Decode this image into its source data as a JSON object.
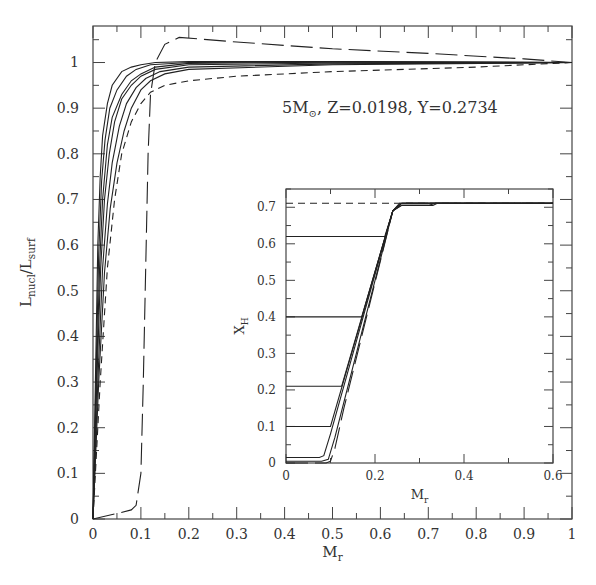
{
  "chart_data": [
    {
      "id": "main",
      "type": "line",
      "title": "",
      "annotation": "5M⊙, Z=0.0198, Y=0.2734",
      "annotation_parts": {
        "mass": "5M",
        "sun_symbol": "⊙",
        "rest": ", Z=0.0198, Y=0.2734"
      },
      "xlabel": "M_r",
      "ylabel": "L_nucl/L_surf",
      "xlim": [
        0,
        1
      ],
      "ylim": [
        0,
        1.08
      ],
      "grid": false,
      "xticks": [
        0,
        0.1,
        0.2,
        0.3,
        0.4,
        0.5,
        0.6,
        0.7,
        0.8,
        0.9,
        1
      ],
      "xtick_labels": [
        "0",
        "0.1",
        "0.2",
        "0.3",
        "0.4",
        "0.5",
        "0.6",
        "0.7",
        "0.8",
        "0.9",
        "1"
      ],
      "yticks": [
        0,
        0.1,
        0.2,
        0.3,
        0.4,
        0.5,
        0.6,
        0.7,
        0.8,
        0.9,
        1
      ],
      "ytick_labels": [
        "0",
        "0.1",
        "0.2",
        "0.3",
        "0.4",
        "0.5",
        "0.6",
        "0.7",
        "0.8",
        "0.9",
        "1"
      ],
      "series": [
        {
          "name": "solid-1",
          "style": "solid",
          "x": [
            0,
            0.005,
            0.01,
            0.015,
            0.02,
            0.03,
            0.04,
            0.06,
            0.08,
            0.1,
            0.13,
            0.2,
            0.5,
            1.0
          ],
          "y": [
            0,
            0.3,
            0.6,
            0.75,
            0.84,
            0.91,
            0.95,
            0.98,
            0.99,
            0.995,
            1.0,
            1.002,
            1.002,
            1.0
          ]
        },
        {
          "name": "solid-2",
          "style": "solid",
          "x": [
            0,
            0.006,
            0.012,
            0.018,
            0.025,
            0.035,
            0.05,
            0.07,
            0.09,
            0.12,
            0.2,
            0.5,
            1.0
          ],
          "y": [
            0,
            0.3,
            0.58,
            0.74,
            0.83,
            0.9,
            0.94,
            0.97,
            0.985,
            0.995,
            1.0,
            1.002,
            1.0
          ]
        },
        {
          "name": "solid-3",
          "style": "solid",
          "x": [
            0,
            0.007,
            0.014,
            0.02,
            0.03,
            0.04,
            0.06,
            0.08,
            0.1,
            0.13,
            0.2,
            0.5,
            1.0
          ],
          "y": [
            0,
            0.3,
            0.56,
            0.7,
            0.82,
            0.88,
            0.93,
            0.96,
            0.975,
            0.99,
            0.998,
            1.001,
            1.0
          ]
        },
        {
          "name": "solid-4",
          "style": "solid",
          "x": [
            0,
            0.008,
            0.016,
            0.024,
            0.034,
            0.045,
            0.06,
            0.08,
            0.1,
            0.13,
            0.2,
            0.5,
            1.0
          ],
          "y": [
            0,
            0.3,
            0.55,
            0.7,
            0.8,
            0.87,
            0.92,
            0.95,
            0.97,
            0.985,
            0.995,
            0.999,
            1.0
          ]
        },
        {
          "name": "solid-5",
          "style": "solid",
          "x": [
            0,
            0.01,
            0.02,
            0.03,
            0.04,
            0.055,
            0.07,
            0.09,
            0.11,
            0.14,
            0.2,
            0.5,
            1.0
          ],
          "y": [
            0,
            0.3,
            0.55,
            0.69,
            0.78,
            0.86,
            0.91,
            0.945,
            0.965,
            0.98,
            0.99,
            0.997,
            1.0
          ]
        },
        {
          "name": "solid-6",
          "style": "solid",
          "x": [
            0,
            0.012,
            0.024,
            0.036,
            0.05,
            0.065,
            0.08,
            0.1,
            0.12,
            0.15,
            0.2,
            0.5,
            1.0
          ],
          "y": [
            0,
            0.3,
            0.54,
            0.68,
            0.78,
            0.85,
            0.9,
            0.94,
            0.96,
            0.975,
            0.985,
            0.995,
            1.0
          ]
        },
        {
          "name": "short-dash",
          "style": "dashed-short",
          "x": [
            0,
            0.015,
            0.03,
            0.045,
            0.06,
            0.08,
            0.1,
            0.12,
            0.15,
            0.2,
            0.3,
            0.5,
            0.8,
            1.0
          ],
          "y": [
            0,
            0.3,
            0.55,
            0.7,
            0.8,
            0.87,
            0.91,
            0.935,
            0.95,
            0.96,
            0.97,
            0.98,
            0.99,
            1.0
          ]
        },
        {
          "name": "long-dash",
          "style": "dashed-long",
          "x": [
            0,
            0.05,
            0.08,
            0.09,
            0.1,
            0.105,
            0.11,
            0.115,
            0.12,
            0.13,
            0.15,
            0.18,
            0.3,
            0.5,
            0.7,
            0.9,
            1.0
          ],
          "y": [
            0,
            0.012,
            0.02,
            0.03,
            0.1,
            0.3,
            0.55,
            0.8,
            0.93,
            1.0,
            1.04,
            1.055,
            1.045,
            1.03,
            1.02,
            1.008,
            1.0
          ]
        }
      ]
    },
    {
      "id": "inset",
      "type": "line",
      "title": "",
      "xlabel": "M_r",
      "ylabel": "X_H",
      "xlim": [
        0,
        0.6
      ],
      "ylim": [
        0,
        0.75
      ],
      "grid": false,
      "xticks": [
        0,
        0.2,
        0.4,
        0.6
      ],
      "xtick_labels": [
        "0",
        "0.2",
        "0.4",
        "0.6"
      ],
      "yticks": [
        0,
        0.1,
        0.2,
        0.3,
        0.4,
        0.5,
        0.6,
        0.7
      ],
      "ytick_labels": [
        "0",
        "0.1",
        "0.2",
        "0.3",
        "0.4",
        "0.5",
        "0.6",
        "0.7"
      ],
      "series": [
        {
          "name": "initial",
          "style": "dashed-short",
          "x": [
            0,
            0.6
          ],
          "y": [
            0.711,
            0.711
          ]
        },
        {
          "name": "XH-0.62",
          "style": "solid",
          "x": [
            0,
            0.222,
            0.24,
            0.255,
            0.6
          ],
          "y": [
            0.62,
            0.62,
            0.69,
            0.711,
            0.711
          ]
        },
        {
          "name": "XH-0.40",
          "style": "solid",
          "x": [
            0,
            0.17,
            0.24,
            0.26,
            0.6
          ],
          "y": [
            0.4,
            0.4,
            0.69,
            0.711,
            0.711
          ]
        },
        {
          "name": "XH-0.21",
          "style": "solid",
          "x": [
            0,
            0.125,
            0.24,
            0.26,
            0.6
          ],
          "y": [
            0.21,
            0.21,
            0.69,
            0.711,
            0.711
          ]
        },
        {
          "name": "XH-0.10",
          "style": "solid",
          "x": [
            0,
            0.1,
            0.24,
            0.26,
            0.6
          ],
          "y": [
            0.1,
            0.1,
            0.69,
            0.711,
            0.711
          ]
        },
        {
          "name": "XH-0.015",
          "style": "solid",
          "x": [
            0,
            0.075,
            0.085,
            0.1,
            0.24,
            0.26,
            0.33,
            0.34,
            0.6
          ],
          "y": [
            0.015,
            0.015,
            0.02,
            0.08,
            0.69,
            0.705,
            0.705,
            0.711,
            0.711
          ]
        },
        {
          "name": "XH-0.005",
          "style": "solid",
          "x": [
            0,
            0.08,
            0.095,
            0.11,
            0.24,
            0.26,
            0.32,
            0.335,
            0.6
          ],
          "y": [
            0.005,
            0.005,
            0.01,
            0.07,
            0.69,
            0.705,
            0.705,
            0.711,
            0.711
          ]
        },
        {
          "name": "XH-0.0",
          "style": "dashed-long",
          "x": [
            0,
            0.09,
            0.1,
            0.11,
            0.13,
            0.24,
            0.26,
            0.6
          ],
          "y": [
            0,
            0,
            0.005,
            0.04,
            0.15,
            0.69,
            0.711,
            0.711
          ]
        }
      ]
    }
  ],
  "layout": {
    "main": {
      "left": 93,
      "right": 572,
      "top": 26,
      "bottom": 519
    },
    "inset": {
      "left": 286,
      "right": 553,
      "top": 189,
      "bottom": 463
    },
    "annotation_pos": {
      "x": 282,
      "y": 113
    },
    "colors": {
      "axis": "#444444",
      "curve": "#222222",
      "text": "#333333",
      "background": "#ffffff"
    }
  }
}
